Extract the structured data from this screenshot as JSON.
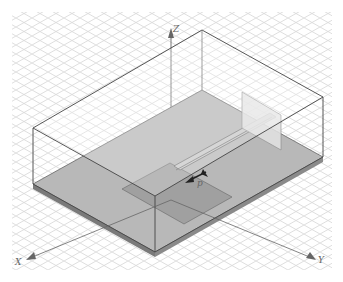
{
  "scene": {
    "title": "3D antenna model viewport (isometric)",
    "background": "#ffffff",
    "grid_color": "#d9d9d9",
    "box_edge_color": "#444444",
    "substrate_fill": "#b3b3b3",
    "patch_fill": "#a3a3a3",
    "port_fill": "#e0e0e0"
  },
  "axes": {
    "z_label": "Z",
    "x_label": "X",
    "y_label": "Y"
  },
  "port": {
    "label": "p"
  }
}
